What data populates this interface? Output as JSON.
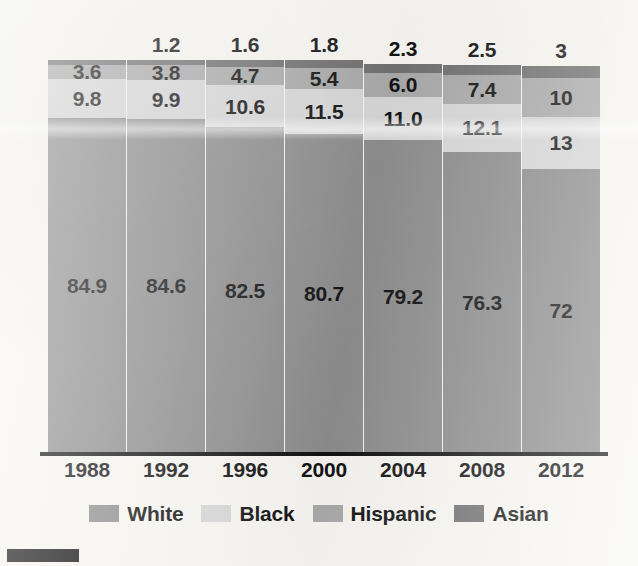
{
  "chart_data": {
    "type": "bar",
    "subtype": "stacked-100-percent",
    "title": "",
    "subtitle": "",
    "xlabel": "",
    "ylabel": "",
    "ylim": [
      0,
      100
    ],
    "grid": false,
    "legend_position": "bottom-center",
    "categories": [
      "1988",
      "1992",
      "1996",
      "2000",
      "2004",
      "2008",
      "2012"
    ],
    "series": [
      {
        "name": "White",
        "color": "#8c8c8c",
        "values": [
          84.9,
          84.6,
          82.5,
          80.7,
          79.2,
          76.3,
          72
        ],
        "labels": [
          "84.9",
          "84.6",
          "82.5",
          "80.7",
          "79.2",
          "76.3",
          "72"
        ]
      },
      {
        "name": "Black",
        "color": "#d6d6d6",
        "values": [
          9.8,
          9.9,
          10.6,
          11.5,
          11.0,
          12.1,
          13
        ],
        "labels": [
          "9.8",
          "9.9",
          "10.6",
          "11.5",
          "11.0",
          "12.1",
          "13"
        ]
      },
      {
        "name": "Hispanic",
        "color": "#a9a9a9",
        "values": [
          3.6,
          3.8,
          4.7,
          5.4,
          6.0,
          7.4,
          10
        ],
        "labels": [
          "3.6",
          "3.8",
          "4.7",
          "5.4",
          "6.0",
          "7.4",
          "10"
        ]
      },
      {
        "name": "Asian",
        "color": "#6f6f6f",
        "values": [
          1.2,
          1.2,
          1.6,
          1.8,
          2.3,
          2.5,
          3
        ],
        "labels": [
          "",
          "1.2",
          "1.6",
          "1.8",
          "2.3",
          "2.5",
          "3"
        ],
        "labels_outside": [
          "1.2",
          "1.2",
          "1.6",
          "1.8",
          "2.3",
          "2.5",
          "3"
        ],
        "label_placement": "above-bar"
      }
    ],
    "stack_order_bottom_to_top": [
      "White",
      "Black",
      "Hispanic",
      "Asian"
    ]
  },
  "legend": {
    "items": [
      {
        "label": "White",
        "color": "#8c8c8c"
      },
      {
        "label": "Black",
        "color": "#d6d6d6"
      },
      {
        "label": "Hispanic",
        "color": "#a9a9a9"
      },
      {
        "label": "Asian",
        "color": "#6f6f6f"
      }
    ]
  },
  "axis": {
    "tick_labels": [
      "1988",
      "1992",
      "1996",
      "2000",
      "2004",
      "2008",
      "2012"
    ],
    "axis_color": "#111111"
  },
  "bars": [
    {
      "category": "1988",
      "asian_above_label": "",
      "segments": [
        {
          "series": "Asian",
          "label": "",
          "value": 1.2,
          "color": "#6f6f6f"
        },
        {
          "series": "Hispanic",
          "label": "3.6",
          "value": 3.6,
          "color": "#a9a9a9"
        },
        {
          "series": "Black",
          "label": "9.8",
          "value": 9.8,
          "color": "#d6d6d6"
        },
        {
          "series": "White",
          "label": "84.9",
          "value": 84.9,
          "color": "#8c8c8c"
        }
      ]
    },
    {
      "category": "1992",
      "asian_above_label": "1.2",
      "segments": [
        {
          "series": "Asian",
          "label": "",
          "value": 1.2,
          "color": "#6f6f6f"
        },
        {
          "series": "Hispanic",
          "label": "3.8",
          "value": 3.8,
          "color": "#a9a9a9"
        },
        {
          "series": "Black",
          "label": "9.9",
          "value": 9.9,
          "color": "#d6d6d6"
        },
        {
          "series": "White",
          "label": "84.6",
          "value": 84.6,
          "color": "#8c8c8c"
        }
      ]
    },
    {
      "category": "1996",
      "asian_above_label": "1.6",
      "segments": [
        {
          "series": "Asian",
          "label": "",
          "value": 1.6,
          "color": "#6f6f6f"
        },
        {
          "series": "Hispanic",
          "label": "4.7",
          "value": 4.7,
          "color": "#a9a9a9"
        },
        {
          "series": "Black",
          "label": "10.6",
          "value": 10.6,
          "color": "#d6d6d6"
        },
        {
          "series": "White",
          "label": "82.5",
          "value": 82.5,
          "color": "#8c8c8c"
        }
      ]
    },
    {
      "category": "2000",
      "asian_above_label": "1.8",
      "segments": [
        {
          "series": "Asian",
          "label": "",
          "value": 1.8,
          "color": "#6f6f6f"
        },
        {
          "series": "Hispanic",
          "label": "5.4",
          "value": 5.4,
          "color": "#a9a9a9"
        },
        {
          "series": "Black",
          "label": "11.5",
          "value": 11.5,
          "color": "#d6d6d6"
        },
        {
          "series": "White",
          "label": "80.7",
          "value": 80.7,
          "color": "#8c8c8c"
        }
      ]
    },
    {
      "category": "2004",
      "asian_above_label": "2.3",
      "segments": [
        {
          "series": "Asian",
          "label": "",
          "value": 2.3,
          "color": "#6f6f6f"
        },
        {
          "series": "Hispanic",
          "label": "6.0",
          "value": 6.0,
          "color": "#a9a9a9"
        },
        {
          "series": "Black",
          "label": "11.0",
          "value": 11.0,
          "color": "#d6d6d6"
        },
        {
          "series": "White",
          "label": "79.2",
          "value": 79.2,
          "color": "#8c8c8c"
        }
      ]
    },
    {
      "category": "2008",
      "asian_above_label": "2.5",
      "segments": [
        {
          "series": "Asian",
          "label": "",
          "value": 2.5,
          "color": "#6f6f6f"
        },
        {
          "series": "Hispanic",
          "label": "7.4",
          "value": 7.4,
          "color": "#a9a9a9"
        },
        {
          "series": "Black",
          "label": "12.1",
          "value": 12.1,
          "color": "#d6d6d6"
        },
        {
          "series": "White",
          "label": "76.3",
          "value": 76.3,
          "color": "#8c8c8c"
        }
      ]
    },
    {
      "category": "2012",
      "asian_above_label": "3",
      "segments": [
        {
          "series": "Asian",
          "label": "",
          "value": 3,
          "color": "#6f6f6f"
        },
        {
          "series": "Hispanic",
          "label": "10",
          "value": 10,
          "color": "#a9a9a9"
        },
        {
          "series": "Black",
          "label": "13",
          "value": 13,
          "color": "#d6d6d6"
        },
        {
          "series": "White",
          "label": "72",
          "value": 72,
          "color": "#8c8c8c"
        }
      ]
    }
  ],
  "layout": {
    "plot_left": 48,
    "bar_width": 78,
    "bar_pitch": 79,
    "plot_bottom_y": 452,
    "plot_top_y": 57,
    "background": "#f6f5f1"
  }
}
